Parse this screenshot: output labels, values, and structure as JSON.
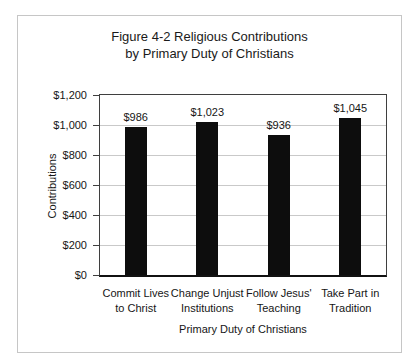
{
  "chart_data": {
    "type": "bar",
    "title": "Figure 4-2 Religious Contributions by Primary Duty of Christians",
    "title_lines": [
      "Figure 4-2 Religious Contributions",
      "by Primary Duty of Christians"
    ],
    "categories": [
      "Commit Lives to Christ",
      "Change Unjust Institutions",
      "Follow Jesus' Teaching",
      "Take Part in Tradition"
    ],
    "category_label_lines": [
      [
        "Commit Lives",
        "to Christ"
      ],
      [
        "Change Unjust",
        "Institutions"
      ],
      [
        "Follow Jesus'",
        "Teaching"
      ],
      [
        "Take Part in",
        "Tradition"
      ]
    ],
    "values": [
      986,
      1023,
      936,
      1045
    ],
    "value_labels": [
      "$986",
      "$1,023",
      "$936",
      "$1,045"
    ],
    "xlabel": "Primary Duty of Christians",
    "ylabel": "Contributions",
    "ylim": [
      0,
      1200
    ],
    "yticks": [
      0,
      200,
      400,
      600,
      800,
      1000,
      1200
    ],
    "ytick_labels": [
      "$0",
      "$200",
      "$400",
      "$600",
      "$800",
      "$1,000",
      "$1,200"
    ],
    "grid": true,
    "legend": false
  },
  "colors": {
    "background": "#ffffff",
    "bar": "#0d0d0d",
    "gridline": "#c9c9c9",
    "plot_border": "#3f3f3f",
    "axis_bottom": "#111111",
    "outer_border": "#c6c6c6",
    "text": "#1c1c1c"
  }
}
